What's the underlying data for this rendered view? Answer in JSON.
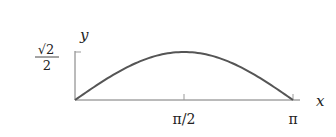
{
  "chart_data": {
    "type": "line",
    "title": "",
    "function": "sin(x) scaled so peak = sqrt(2)/2",
    "xlabel": "x",
    "ylabel": "y",
    "x_ticks": [
      "π/2",
      "π"
    ],
    "y_ticks": [
      "√2/2"
    ],
    "xlim": [
      0,
      3.1416
    ],
    "ylim": [
      0,
      0.7071
    ],
    "grid": false,
    "legend": null,
    "series": [
      {
        "name": "curve",
        "x": [
          0,
          0.3927,
          0.7854,
          1.1781,
          1.5708,
          1.9635,
          2.3562,
          2.7489,
          3.1416
        ],
        "values": [
          0,
          0.2706,
          0.5,
          0.6533,
          0.7071,
          0.6533,
          0.5,
          0.2706,
          0
        ]
      }
    ]
  },
  "labels": {
    "x_axis": "x",
    "y_axis": "y",
    "xtick_half_pi": "π/2",
    "xtick_pi": "π",
    "ytick_sqrt": "√2",
    "ytick_den": "2"
  },
  "colors": {
    "axis": "#555555",
    "curve": "#555555",
    "text": "#222222"
  }
}
